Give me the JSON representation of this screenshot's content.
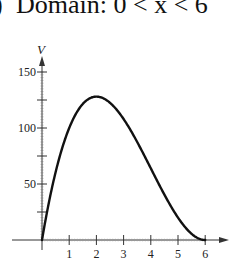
{
  "caption": {
    "prefix": ")",
    "text": "Domain: 0 < x < 6",
    "second_line_fragment": ")"
  },
  "chart_data": {
    "type": "line",
    "title": "",
    "xlabel": "",
    "ylabel": "V",
    "xlim": [
      0,
      6
    ],
    "ylim": [
      0,
      150
    ],
    "x_ticks": [
      1,
      2,
      3,
      4,
      5,
      6
    ],
    "x_tick_labels": [
      "1",
      "2",
      "3",
      "4",
      "5",
      "6"
    ],
    "y_ticks": [
      25,
      50,
      75,
      100,
      125,
      150
    ],
    "y_tick_labels": [
      "",
      "50",
      "",
      "100",
      "",
      "150"
    ],
    "grid": false,
    "legend": null,
    "function": "V = x(12 - 2x)^2",
    "series": [
      {
        "name": "V",
        "x": [
          0,
          0.25,
          0.5,
          0.75,
          1,
          1.5,
          2,
          2.5,
          3,
          3.5,
          4,
          4.5,
          5,
          5.5,
          6
        ],
        "values": [
          0,
          33.06,
          60.5,
          82.69,
          100,
          121.5,
          128,
          122.5,
          108,
          87.5,
          64,
          40.5,
          20,
          5.5,
          0
        ]
      }
    ],
    "annotations": [
      "Maximum near x = 2, V = 128"
    ]
  },
  "colors": {
    "curve": "#111111",
    "axis": "#333333",
    "background": "#ffffff"
  }
}
